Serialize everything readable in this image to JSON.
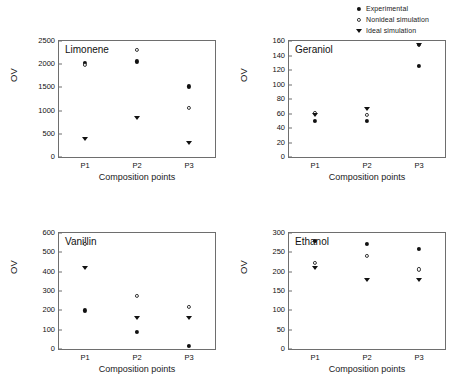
{
  "legend": {
    "position": "top-right",
    "items": [
      {
        "label": "Experimental",
        "marker": "filled-circle",
        "icon": "filled-circle-icon"
      },
      {
        "label": "Nonideal simulation",
        "marker": "open-circle",
        "icon": "open-circle-icon"
      },
      {
        "label": "Ideal simulation",
        "marker": "filled-triangle",
        "icon": "filled-triangle-down-icon"
      }
    ]
  },
  "chart_data": [
    {
      "type": "scatter",
      "title": "Limonene",
      "xlabel": "Composition points",
      "ylabel": "OV",
      "categories": [
        "P1",
        "P2",
        "P3"
      ],
      "ylim": [
        0,
        2500
      ],
      "yticks": [
        0,
        500,
        1000,
        1500,
        2000,
        2500
      ],
      "grid": false,
      "series": [
        {
          "name": "Experimental",
          "marker": "filled-circle",
          "values": [
            2020,
            2060,
            1520
          ]
        },
        {
          "name": "Nonideal simulation",
          "marker": "open-circle",
          "values": [
            1980,
            2310,
            1060
          ]
        },
        {
          "name": "Ideal simulation",
          "marker": "filled-triangle",
          "values": [
            380,
            840,
            300
          ]
        }
      ]
    },
    {
      "type": "scatter",
      "title": "Geraniol",
      "xlabel": "Composition points",
      "ylabel": "OV",
      "categories": [
        "P1",
        "P2",
        "P3"
      ],
      "ylim": [
        0,
        160
      ],
      "yticks": [
        0,
        20,
        40,
        60,
        80,
        100,
        120,
        140,
        160
      ],
      "grid": false,
      "series": [
        {
          "name": "Experimental",
          "marker": "filled-circle",
          "values": [
            50,
            50,
            126
          ]
        },
        {
          "name": "Nonideal simulation",
          "marker": "open-circle",
          "values": [
            61,
            58,
            155
          ]
        },
        {
          "name": "Ideal simulation",
          "marker": "filled-triangle",
          "values": [
            58,
            66,
            155
          ]
        }
      ]
    },
    {
      "type": "scatter",
      "title": "Vanillin",
      "xlabel": "Composition points",
      "ylabel": "OV",
      "categories": [
        "P1",
        "P2",
        "P3"
      ],
      "ylim": [
        0,
        600
      ],
      "yticks": [
        0,
        100,
        200,
        300,
        400,
        500,
        600
      ],
      "grid": false,
      "series": [
        {
          "name": "Experimental",
          "marker": "filled-circle",
          "values": [
            200,
            90,
            15
          ]
        },
        {
          "name": "Nonideal simulation",
          "marker": "open-circle",
          "values": [
            545,
            275,
            218
          ]
        },
        {
          "name": "Ideal simulation",
          "marker": "filled-triangle",
          "values": [
            417,
            158,
            160
          ]
        }
      ]
    },
    {
      "type": "scatter",
      "title": "Ethanol",
      "xlabel": "Composition points",
      "ylabel": "OV",
      "categories": [
        "P1",
        "P2",
        "P3"
      ],
      "ylim": [
        0,
        300
      ],
      "yticks": [
        0,
        50,
        100,
        150,
        200,
        250,
        300
      ],
      "grid": false,
      "series": [
        {
          "name": "Experimental",
          "marker": "filled-circle",
          "values": [
            280,
            272,
            258
          ]
        },
        {
          "name": "Nonideal simulation",
          "marker": "open-circle",
          "values": [
            222,
            240,
            206
          ]
        },
        {
          "name": "Ideal simulation",
          "marker": "filled-triangle",
          "values": [
            210,
            178,
            179
          ]
        }
      ]
    }
  ]
}
